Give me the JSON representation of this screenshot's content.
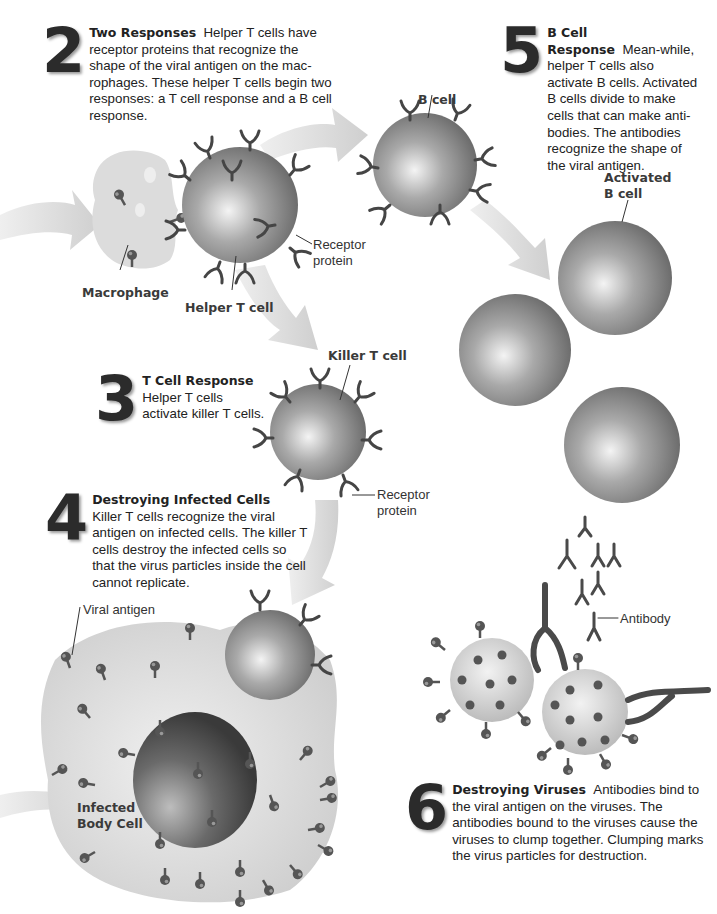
{
  "steps": [
    {
      "number": "2",
      "title": "Two Responses",
      "body": "Helper T cells have receptor proteins that recognize the shape of the viral antigen on the mac-rophages. These helper T cells begin two responses: a T cell response and a B cell response."
    },
    {
      "number": "3",
      "title": "T Cell Response",
      "body": "Helper T cells activate killer T cells."
    },
    {
      "number": "4",
      "title": "Destroying Infected Cells",
      "body": "Killer T cells recognize the viral antigen on infected cells. The killer T cells destroy the infected cells so that the virus particles inside the cell cannot replicate."
    },
    {
      "number": "5",
      "title": "B Cell Response",
      "body": "Mean-while, helper T cells also activate B cells. Activated B cells divide to make cells that can make anti-bodies. The antibodies recognize the shape of the viral antigen."
    },
    {
      "number": "6",
      "title": "Destroying Viruses",
      "body": "Antibodies bind to the viral antigen on the viruses. The antibodies bound to the viruses cause the viruses to clump together. Clumping marks the virus particles for destruction."
    }
  ],
  "labels": {
    "macrophage": "Macrophage",
    "helper_t_cell": "Helper T cell",
    "receptor_protein_1": "Receptor protein",
    "b_cell": "B cell",
    "activated_b_cell": "Activated B cell",
    "killer_t_cell": "Killer T cell",
    "receptor_protein_2": "Receptor protein",
    "viral_antigen": "Viral antigen",
    "infected_body_cell": "Infected Body Cell",
    "antibody": "Antibody"
  },
  "colors": {
    "cell_dark": "#6e6e6e",
    "cell_light": "#d8d8d8",
    "arrow": "#d6d6d6",
    "receptor": "#4a4a4a",
    "text": "#222222"
  }
}
